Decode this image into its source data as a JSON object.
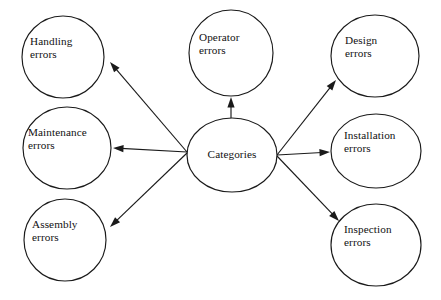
{
  "diagram": {
    "type": "node-link-diagram",
    "title": "Categories",
    "background_color": "#ffffff",
    "stroke_color": "#1a1a1a",
    "text_color": "#111111",
    "center_node": {
      "id": "categories",
      "label": "Categories",
      "shape": "ellipse",
      "cx": 232,
      "cy": 155,
      "rx": 45,
      "ry": 37
    },
    "nodes": [
      {
        "id": "handling-errors",
        "label": "Handling\nerrors",
        "shape": "circle",
        "cx": 63,
        "cy": 57,
        "rx": 41,
        "ry": 41,
        "label_x": 30,
        "label_y": 35,
        "label_width": 70,
        "align": "left"
      },
      {
        "id": "maintenance-errors",
        "label": "Maintenance\nerrors",
        "shape": "circle",
        "cx": 67,
        "cy": 148,
        "rx": 44,
        "ry": 41,
        "label_x": 28,
        "label_y": 126,
        "label_width": 82,
        "align": "left"
      },
      {
        "id": "assembly-errors",
        "label": "Assembly\nerrors",
        "shape": "circle",
        "cx": 65,
        "cy": 240,
        "rx": 41,
        "ry": 41,
        "label_x": 32,
        "label_y": 218,
        "label_width": 70,
        "align": "left"
      },
      {
        "id": "operator-errors",
        "label": "Operator\nerrors",
        "shape": "circle",
        "cx": 231,
        "cy": 53,
        "rx": 42,
        "ry": 43,
        "label_x": 199,
        "label_y": 31,
        "label_width": 70,
        "align": "left"
      },
      {
        "id": "design-errors",
        "label": "Design\nerrors",
        "shape": "circle",
        "cx": 375,
        "cy": 56,
        "rx": 44,
        "ry": 41,
        "label_x": 345,
        "label_y": 34,
        "label_width": 66,
        "align": "left"
      },
      {
        "id": "installation-errors",
        "label": "Installation\nerrors",
        "shape": "circle",
        "cx": 376,
        "cy": 151,
        "rx": 45,
        "ry": 37,
        "label_x": 344,
        "label_y": 129,
        "label_width": 78,
        "align": "left"
      },
      {
        "id": "inspection-errors",
        "label": "Inspection\nerrors",
        "shape": "circle",
        "cx": 376,
        "cy": 245,
        "rx": 45,
        "ry": 41,
        "label_x": 344,
        "label_y": 223,
        "label_width": 76,
        "align": "left"
      }
    ],
    "edges": [
      {
        "id": "edge-categories-handling",
        "from": "categories",
        "to": "handling-errors",
        "x1": 187,
        "y1": 152,
        "x2": 110,
        "y2": 62,
        "direction": "to-target"
      },
      {
        "id": "edge-categories-maintenance",
        "from": "categories",
        "to": "maintenance-errors",
        "x1": 187,
        "y1": 152,
        "x2": 113,
        "y2": 148,
        "direction": "to-target"
      },
      {
        "id": "edge-categories-assembly",
        "from": "categories",
        "to": "assembly-errors",
        "x1": 187,
        "y1": 153,
        "x2": 110,
        "y2": 227,
        "direction": "to-target"
      },
      {
        "id": "edge-categories-operator",
        "from": "categories",
        "to": "operator-errors",
        "x1": 231,
        "y1": 119,
        "x2": 231,
        "y2": 97,
        "direction": "to-target"
      },
      {
        "id": "edge-categories-design",
        "from": "categories",
        "to": "design-errors",
        "x1": 277,
        "y1": 155,
        "x2": 336,
        "y2": 80,
        "direction": "to-target"
      },
      {
        "id": "edge-categories-installation",
        "from": "categories",
        "to": "installation-errors",
        "x1": 277,
        "y1": 155,
        "x2": 330,
        "y2": 152,
        "direction": "to-target"
      },
      {
        "id": "edge-categories-inspection",
        "from": "categories",
        "to": "inspection-errors",
        "x1": 277,
        "y1": 156,
        "x2": 339,
        "y2": 221,
        "direction": "to-target"
      }
    ]
  }
}
